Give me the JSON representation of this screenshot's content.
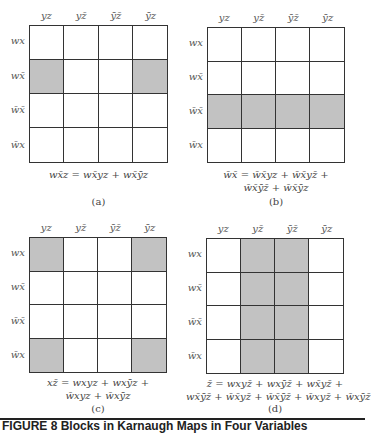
{
  "column_labels": [
    "yz",
    "yz̄",
    "ȳz̄",
    "ȳz"
  ],
  "row_labels": [
    "wx",
    "wx̄",
    "w̄x̄",
    "w̄x"
  ],
  "maps": [
    {
      "id": "a",
      "sublabel": "(a)",
      "shaded": [
        [
          0,
          0,
          0,
          0
        ],
        [
          1,
          0,
          0,
          1
        ],
        [
          0,
          0,
          0,
          0
        ],
        [
          0,
          0,
          0,
          0
        ]
      ],
      "expression_lines": [
        "wx̄z = wx̄yz + wx̄ȳz"
      ]
    },
    {
      "id": "b",
      "sublabel": "(b)",
      "shaded": [
        [
          0,
          0,
          0,
          0
        ],
        [
          0,
          0,
          0,
          0
        ],
        [
          1,
          1,
          1,
          1
        ],
        [
          0,
          0,
          0,
          0
        ]
      ],
      "expression_lines": [
        "w̄x̄ = w̄x̄yz + w̄x̄yz̄ +",
        "w̄x̄ȳz̄ + w̄x̄ȳz"
      ]
    },
    {
      "id": "c",
      "sublabel": "(c)",
      "shaded": [
        [
          1,
          0,
          0,
          1
        ],
        [
          0,
          0,
          0,
          0
        ],
        [
          0,
          0,
          0,
          0
        ],
        [
          1,
          0,
          0,
          1
        ]
      ],
      "expression_lines": [
        "xz̄ = wxyz + wxȳz +",
        "w̄xyz + w̄xȳz"
      ]
    },
    {
      "id": "d",
      "sublabel": "(d)",
      "shaded": [
        [
          0,
          1,
          1,
          0
        ],
        [
          0,
          1,
          1,
          0
        ],
        [
          0,
          1,
          1,
          0
        ],
        [
          0,
          1,
          1,
          0
        ]
      ],
      "expression_lines": [
        "z̄ = wxyz̄ + wxȳz̄ + wx̄yz̄ +",
        "wx̄ȳz̄ + w̄x̄yz̄ + w̄x̄ȳz̄ + w̄xyz̄ + w̄xȳz̄"
      ]
    }
  ],
  "caption": "FIGURE 8   Blocks in Karnaugh Maps in Four Variables",
  "colors": {
    "shade": "#c2c2c2",
    "line": "#333333"
  }
}
